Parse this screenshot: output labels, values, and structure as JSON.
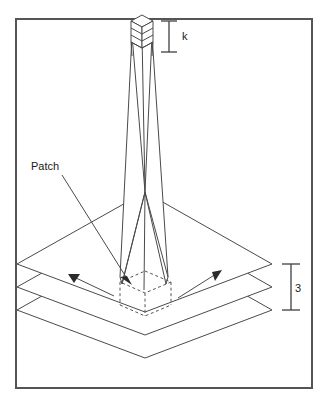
{
  "figure": {
    "background_color": "#ffffff",
    "frame_color": "#555555",
    "line_color": "#4a4a4a",
    "dashed_color": "#555555",
    "arrow_color": "#2b2b2b",
    "text_color": "#1a1a1a"
  },
  "labels": {
    "patch": "Patch",
    "kernel_dim": "k",
    "depth_dim": "3"
  },
  "annotations": {
    "patch_leader_description": "Leader line from Patch label to dashed patch cube",
    "left_arrow_description": "Arrow pointing up-left across the plates",
    "right_arrow_description": "Arrow pointing up-right across the plates"
  },
  "structure": {
    "plate_count": 3,
    "column_segments": 3,
    "patch_shape": "dashed-isometric-cube",
    "column_top_shape": "isometric-cube-stack"
  }
}
